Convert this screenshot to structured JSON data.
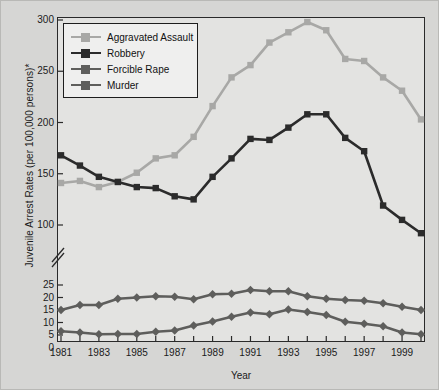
{
  "chart_data": {
    "type": "line",
    "title": "",
    "xlabel": "Year",
    "ylabel": "Juvenile Arrest Rates (per 100,000 persons)*",
    "grid": false,
    "legend_position": "top-left",
    "axis_note": "broken y-axis: lower panel 0-25 (step 5), upper panel 100-300 (step 50)",
    "x": [
      1981,
      1982,
      1983,
      1984,
      1985,
      1986,
      1987,
      1988,
      1989,
      1990,
      1991,
      1992,
      1993,
      1994,
      1995,
      1996,
      1997,
      1998,
      1999,
      2000
    ],
    "xlim": [
      1981,
      2000
    ],
    "xticks": [
      1981,
      1983,
      1985,
      1987,
      1989,
      1991,
      1993,
      1995,
      1997,
      1999
    ],
    "xtick_labels": [
      "1981",
      "1983",
      "1985",
      "1987",
      "1989",
      "1991",
      "1993",
      "1995",
      "1997",
      "1999"
    ],
    "y_upper": {
      "lim": [
        100,
        300
      ],
      "ticks": [
        100,
        150,
        200,
        250,
        300
      ],
      "tick_labels": [
        "100",
        "150",
        "200",
        "250",
        "300"
      ]
    },
    "y_lower": {
      "lim": [
        0,
        25
      ],
      "ticks": [
        0,
        5,
        10,
        15,
        20,
        25
      ],
      "tick_labels": [
        "0",
        "5",
        "10",
        "15",
        "20",
        "25"
      ]
    },
    "series": [
      {
        "name": "Aggravated Assault",
        "color": "#a8a8a6",
        "marker": "square",
        "panel": "upper",
        "values": [
          141,
          143,
          137,
          142,
          151,
          165,
          168,
          186,
          216,
          244,
          256,
          278,
          288,
          298,
          290,
          262,
          260,
          244,
          231,
          203
        ]
      },
      {
        "name": "Robbery",
        "color": "#2b2b2b",
        "marker": "square",
        "panel": "upper",
        "values": [
          168,
          158,
          147,
          142,
          137,
          136,
          128,
          125,
          147,
          165,
          184,
          183,
          195,
          208,
          208,
          185,
          172,
          119,
          105,
          92
        ]
      },
      {
        "name": "Forcible Rape",
        "color": "#5e5e5c",
        "marker": "diamond",
        "panel": "lower",
        "values": [
          15,
          17,
          17,
          19.5,
          20,
          20.5,
          20.3,
          19.3,
          21.3,
          21.5,
          23,
          22.5,
          22.5,
          20.5,
          19.5,
          19,
          18.7,
          17.7,
          16.3,
          15
        ]
      },
      {
        "name": "Murder",
        "color": "#5e5e5c",
        "marker": "diamond",
        "panel": "lower",
        "values": [
          6.5,
          6,
          5.3,
          5.4,
          5.4,
          6.3,
          6.8,
          8.8,
          10.4,
          12.3,
          14,
          13.3,
          15.2,
          14.2,
          13,
          10.3,
          9.5,
          8.5,
          6,
          5.3
        ]
      }
    ]
  },
  "axis": {
    "ytitle": "Juvenile Arrest Rates (per 100,000 persons)*",
    "xtitle": "Year"
  },
  "legend": {
    "entries": [
      {
        "label": "Aggravated Assault"
      },
      {
        "label": "Robbery"
      },
      {
        "label": "Forcible Rape"
      },
      {
        "label": "Murder"
      }
    ]
  }
}
